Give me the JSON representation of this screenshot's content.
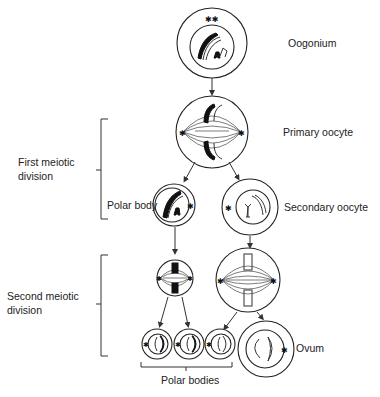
{
  "stages": {
    "oogonium": "Oogonium",
    "primary_oocyte": "Primary oocyte",
    "polar_body": "Polar body",
    "secondary_oocyte": "Secondary oocyte",
    "ovum": "Ovum",
    "polar_bodies": "Polar bodies"
  },
  "divisions": {
    "first": [
      "First meiotic",
      "division"
    ],
    "second": [
      "Second meiotic",
      "division"
    ]
  }
}
